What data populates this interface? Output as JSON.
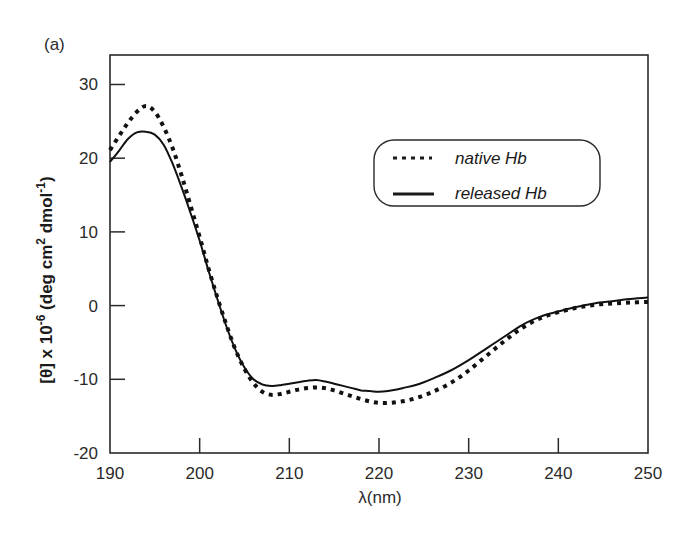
{
  "panel_label": "(a)",
  "chart_data": {
    "type": "line",
    "title": "",
    "panel": "(a)",
    "xlabel": "λ(nm)",
    "ylabel": "[θ] x 10-6 (deg cm2 dmol-1)",
    "ylabel_parts": {
      "pre": "[θ] x 10",
      "exp1": "-6",
      "mid": " (deg cm",
      "exp2": "2",
      "mid2": " dmol",
      "exp3": "-1",
      "post": ")"
    },
    "xlim": [
      190,
      250
    ],
    "ylim": [
      -20,
      34
    ],
    "xticks": [
      190,
      200,
      210,
      220,
      230,
      240,
      250
    ],
    "yticks": [
      -20,
      -10,
      0,
      10,
      20,
      30
    ],
    "xtick_labels": [
      "190",
      "200",
      "210",
      "220",
      "230",
      "240",
      "250"
    ],
    "ytick_labels": [
      "-20",
      "-10",
      "0",
      "10",
      "20",
      "30"
    ],
    "grid": false,
    "legend_position": "upper right (inside, rounded box)",
    "series": [
      {
        "name": "native Hb",
        "style": "dotted",
        "x": [
          190,
          191,
          192,
          193,
          194,
          195,
          196,
          197,
          198,
          199,
          200,
          201,
          202,
          203,
          204,
          205,
          206,
          207,
          208,
          209,
          210,
          211,
          212,
          213,
          214,
          215,
          216,
          217,
          218,
          219,
          220,
          221,
          222,
          223,
          224,
          225,
          226,
          228,
          230,
          232,
          234,
          236,
          238,
          240,
          242,
          244,
          246,
          248,
          250
        ],
        "values": [
          21.1,
          23.0,
          24.8,
          26.3,
          27.1,
          26.3,
          24.2,
          21.3,
          17.6,
          13.5,
          9.3,
          5.0,
          1.0,
          -2.7,
          -6.0,
          -8.6,
          -10.5,
          -11.7,
          -12.1,
          -12.0,
          -11.7,
          -11.4,
          -11.2,
          -11.1,
          -11.2,
          -11.5,
          -11.9,
          -12.3,
          -12.7,
          -13.0,
          -13.2,
          -13.2,
          -13.1,
          -12.9,
          -12.6,
          -12.2,
          -11.7,
          -10.5,
          -8.8,
          -6.8,
          -4.8,
          -3.0,
          -1.7,
          -0.9,
          -0.3,
          0.1,
          0.3,
          0.4,
          0.5
        ]
      },
      {
        "name": "released Hb",
        "style": "solid",
        "x": [
          190,
          191,
          192,
          193,
          194,
          195,
          196,
          197,
          198,
          199,
          200,
          201,
          202,
          203,
          204,
          205,
          206,
          207,
          208,
          209,
          210,
          211,
          212,
          213,
          214,
          215,
          216,
          217,
          218,
          219,
          220,
          221,
          222,
          223,
          224,
          225,
          226,
          228,
          230,
          232,
          234,
          236,
          238,
          240,
          242,
          244,
          246,
          248,
          250
        ],
        "values": [
          19.5,
          21.0,
          22.6,
          23.5,
          23.6,
          23.2,
          21.8,
          19.2,
          16.0,
          12.5,
          8.8,
          4.7,
          0.8,
          -2.9,
          -6.0,
          -8.4,
          -10.0,
          -10.7,
          -10.9,
          -10.8,
          -10.6,
          -10.4,
          -10.2,
          -10.1,
          -10.3,
          -10.6,
          -10.9,
          -11.2,
          -11.5,
          -11.6,
          -11.7,
          -11.6,
          -11.4,
          -11.1,
          -10.8,
          -10.4,
          -9.9,
          -8.8,
          -7.4,
          -5.8,
          -4.2,
          -2.6,
          -1.5,
          -0.8,
          -0.2,
          0.3,
          0.6,
          0.9,
          1.1
        ]
      }
    ]
  }
}
